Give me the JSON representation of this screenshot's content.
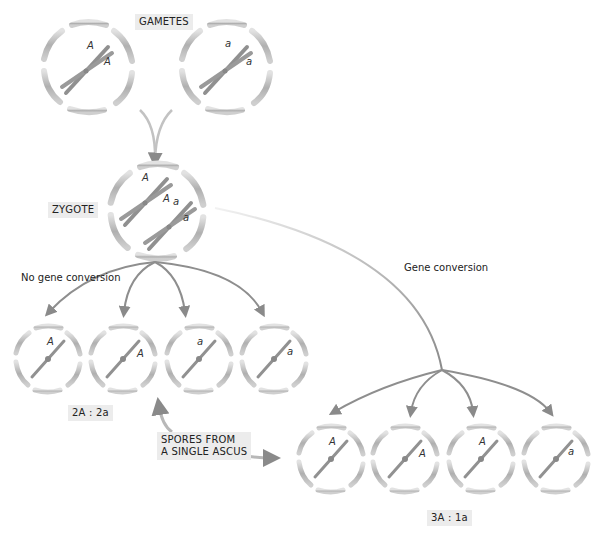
{
  "title_labels": {
    "gametes": "GAMETES",
    "zygote": "ZYGOTE",
    "no_gene_conversion": "No gene conversion",
    "gene_conversion": "Gene conversion",
    "spores_line1": "SPORES FROM",
    "spores_line2": "A SINGLE ASCUS",
    "ratio_normal": "2A : 2a",
    "ratio_conversion": "3A : 1a"
  },
  "gametes": [
    {
      "alleles": [
        "A",
        "A"
      ]
    },
    {
      "alleles": [
        "a",
        "a"
      ]
    }
  ],
  "zygote": {
    "alleles": [
      "A",
      "A",
      "a",
      "a"
    ]
  },
  "spores_no_conversion": [
    "A",
    "A",
    "a",
    "a"
  ],
  "spores_gene_conversion": [
    "A",
    "A",
    "A",
    "a"
  ],
  "colors": {
    "cell_wall": "#b5b5b5",
    "chromosome": "#8f8f8f",
    "arrow": "#8a8a8a",
    "label_bg": "#ececec"
  }
}
